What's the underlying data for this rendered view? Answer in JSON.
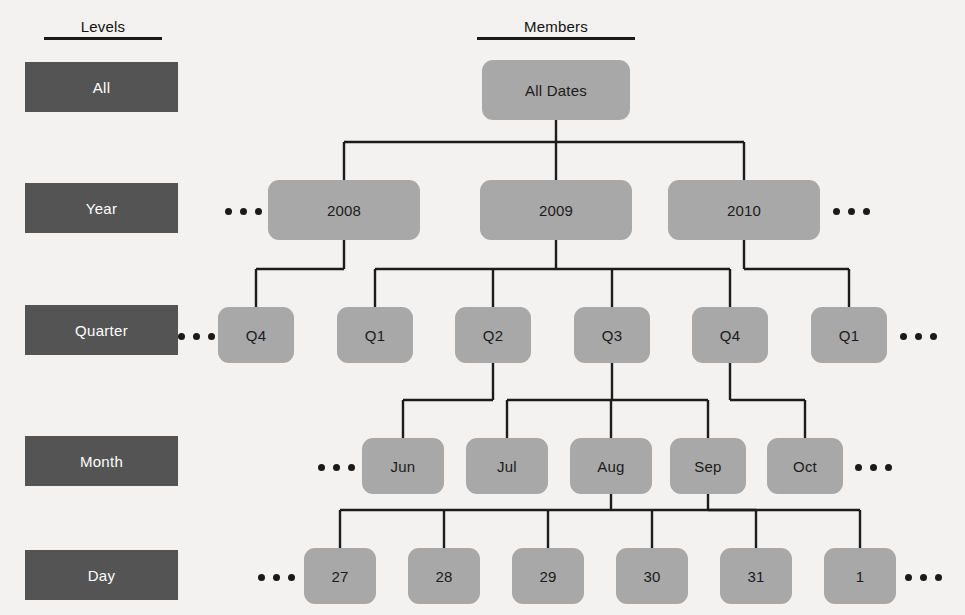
{
  "headers": {
    "levels": "Levels",
    "members": "Members"
  },
  "levels": [
    {
      "label": "All",
      "x": 25,
      "y": 62,
      "w": 153,
      "h": 50
    },
    {
      "label": "Year",
      "x": 25,
      "y": 183,
      "w": 153,
      "h": 50
    },
    {
      "label": "Quarter",
      "x": 25,
      "y": 305,
      "w": 153,
      "h": 50
    },
    {
      "label": "Month",
      "x": 25,
      "y": 436,
      "w": 153,
      "h": 50
    },
    {
      "label": "Day",
      "x": 25,
      "y": 550,
      "w": 153,
      "h": 50
    }
  ],
  "nodes": [
    {
      "id": "all-dates",
      "label": "All Dates",
      "level": "All",
      "x": 482,
      "y": 60,
      "w": 148,
      "h": 60
    },
    {
      "id": "y2008",
      "label": "2008",
      "level": "Year",
      "x": 268,
      "y": 180,
      "w": 152,
      "h": 60
    },
    {
      "id": "y2009",
      "label": "2009",
      "level": "Year",
      "x": 480,
      "y": 180,
      "w": 152,
      "h": 60
    },
    {
      "id": "y2010",
      "label": "2010",
      "level": "Year",
      "x": 668,
      "y": 180,
      "w": 152,
      "h": 60
    },
    {
      "id": "q2008-4",
      "label": "Q4",
      "level": "Quarter",
      "x": 218,
      "y": 307,
      "w": 76,
      "h": 56
    },
    {
      "id": "q2009-1",
      "label": "Q1",
      "level": "Quarter",
      "x": 337,
      "y": 307,
      "w": 76,
      "h": 56
    },
    {
      "id": "q2009-2",
      "label": "Q2",
      "level": "Quarter",
      "x": 455,
      "y": 307,
      "w": 76,
      "h": 56
    },
    {
      "id": "q2009-3",
      "label": "Q3",
      "level": "Quarter",
      "x": 574,
      "y": 307,
      "w": 76,
      "h": 56
    },
    {
      "id": "q2009-4",
      "label": "Q4",
      "level": "Quarter",
      "x": 692,
      "y": 307,
      "w": 76,
      "h": 56
    },
    {
      "id": "q2010-1",
      "label": "Q1",
      "level": "Quarter",
      "x": 811,
      "y": 307,
      "w": 76,
      "h": 56
    },
    {
      "id": "m-jun",
      "label": "Jun",
      "level": "Month",
      "x": 362,
      "y": 438,
      "w": 82,
      "h": 56
    },
    {
      "id": "m-jul",
      "label": "Jul",
      "level": "Month",
      "x": 466,
      "y": 438,
      "w": 82,
      "h": 56
    },
    {
      "id": "m-aug",
      "label": "Aug",
      "level": "Month",
      "x": 570,
      "y": 438,
      "w": 82,
      "h": 56
    },
    {
      "id": "m-sep",
      "label": "Sep",
      "level": "Month",
      "x": 670,
      "y": 438,
      "w": 76,
      "h": 56
    },
    {
      "id": "m-oct",
      "label": "Oct",
      "level": "Month",
      "x": 767,
      "y": 438,
      "w": 76,
      "h": 56
    },
    {
      "id": "d-27",
      "label": "27",
      "level": "Day",
      "x": 304,
      "y": 548,
      "w": 72,
      "h": 56
    },
    {
      "id": "d-28",
      "label": "28",
      "level": "Day",
      "x": 408,
      "y": 548,
      "w": 72,
      "h": 56
    },
    {
      "id": "d-29",
      "label": "29",
      "level": "Day",
      "x": 512,
      "y": 548,
      "w": 72,
      "h": 56
    },
    {
      "id": "d-30",
      "label": "30",
      "level": "Day",
      "x": 616,
      "y": 548,
      "w": 72,
      "h": 56
    },
    {
      "id": "d-31",
      "label": "31",
      "level": "Day",
      "x": 720,
      "y": 548,
      "w": 72,
      "h": 56
    },
    {
      "id": "d-1",
      "label": "1",
      "level": "Day",
      "x": 824,
      "y": 548,
      "w": 72,
      "h": 56
    }
  ],
  "ellipses": [
    {
      "id": "ell-year-left",
      "x": 225,
      "y": 206
    },
    {
      "id": "ell-year-right",
      "x": 833,
      "y": 206
    },
    {
      "id": "ell-quarter-left",
      "x": 178,
      "y": 331
    },
    {
      "id": "ell-quarter-right",
      "x": 900,
      "y": 331
    },
    {
      "id": "ell-month-left",
      "x": 318,
      "y": 462
    },
    {
      "id": "ell-month-right",
      "x": 855,
      "y": 462
    },
    {
      "id": "ell-day-left",
      "x": 258,
      "y": 572
    },
    {
      "id": "ell-day-right",
      "x": 905,
      "y": 572
    }
  ],
  "edges": [
    {
      "from": "all-dates",
      "to": "y2008"
    },
    {
      "from": "all-dates",
      "to": "y2009"
    },
    {
      "from": "all-dates",
      "to": "y2010"
    },
    {
      "from": "y2008",
      "to": "q2008-4"
    },
    {
      "from": "y2009",
      "to": "q2009-1"
    },
    {
      "from": "y2009",
      "to": "q2009-2"
    },
    {
      "from": "y2009",
      "to": "q2009-3"
    },
    {
      "from": "y2009",
      "to": "q2009-4"
    },
    {
      "from": "y2010",
      "to": "q2010-1"
    },
    {
      "from": "q2009-2",
      "to": "m-jun"
    },
    {
      "from": "q2009-3",
      "to": "m-jul"
    },
    {
      "from": "q2009-3",
      "to": "m-aug"
    },
    {
      "from": "q2009-3",
      "to": "m-sep"
    },
    {
      "from": "q2009-4",
      "to": "m-oct"
    },
    {
      "from": "m-aug",
      "to": "d-27"
    },
    {
      "from": "m-aug",
      "to": "d-28"
    },
    {
      "from": "m-aug",
      "to": "d-29"
    },
    {
      "from": "m-aug",
      "to": "d-30"
    },
    {
      "from": "m-aug",
      "to": "d-31"
    },
    {
      "from": "m-sep",
      "to": "d-1"
    }
  ],
  "colors": {
    "background": "#f3f2f0",
    "level_box": "#545454",
    "level_text": "#ffffff",
    "node_fill": "#a8a8a8",
    "node_text": "#1b1b1b",
    "connector": "#1c1c1c"
  },
  "header_positions": {
    "levels": {
      "x": 44,
      "y": 18,
      "w": 118
    },
    "members": {
      "x": 477,
      "y": 18,
      "w": 158
    }
  }
}
